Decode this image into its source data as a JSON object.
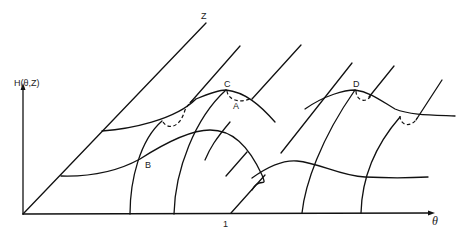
{
  "diagram": {
    "type": "3d-surface-sketch",
    "axes": {
      "vertical_label": "H(θ,Z)",
      "horizontal_label": "θ",
      "depth_label": "Z",
      "tick_label": "1"
    },
    "points": [
      {
        "id": "A",
        "label": "A"
      },
      {
        "id": "B",
        "label": "B"
      },
      {
        "id": "C",
        "label": "C"
      },
      {
        "id": "D",
        "label": "D"
      }
    ],
    "colors": {
      "stroke": "#111111",
      "background": "#ffffff"
    }
  }
}
